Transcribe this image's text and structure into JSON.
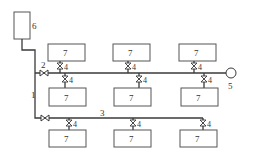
{
  "diagram": {
    "labels": {
      "tank": "6",
      "riser": "1",
      "main_valve": "2",
      "lower_line": "3",
      "branch_valve": "4",
      "end_unit": "5",
      "unit": "7"
    },
    "rows": [
      {
        "name": "upper-above",
        "units": [
          "7",
          "7",
          "7"
        ],
        "valves": [
          "4",
          "4",
          "4"
        ]
      },
      {
        "name": "upper-below",
        "units": [
          "7",
          "7",
          "7"
        ],
        "valves": [
          "4",
          "4",
          "4"
        ]
      },
      {
        "name": "lower-below",
        "units": [
          "7",
          "7",
          "7"
        ],
        "valves": [
          "4",
          "4",
          "4"
        ]
      }
    ],
    "colors": {
      "line": "#3a3a3a",
      "box_stroke": "#555555",
      "text": "#333333",
      "background": "#ffffff"
    }
  }
}
